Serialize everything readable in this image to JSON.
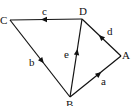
{
  "diagram": {
    "type": "vector-quadrilateral",
    "points": [
      {
        "id": "C",
        "label": "C",
        "x": 10,
        "y": 20
      },
      {
        "id": "D",
        "label": "D",
        "x": 82,
        "y": 19
      },
      {
        "id": "A",
        "label": "A",
        "x": 121,
        "y": 56
      },
      {
        "id": "B",
        "label": "B",
        "x": 70,
        "y": 97
      }
    ],
    "edges": [
      {
        "label": "c",
        "from": "D",
        "to": "C"
      },
      {
        "label": "b",
        "from": "C",
        "to": "B"
      },
      {
        "label": "a",
        "from": "B",
        "to": "A"
      },
      {
        "label": "d",
        "from": "A",
        "to": "D"
      },
      {
        "label": "e",
        "from": "B",
        "to": "D"
      }
    ],
    "stroke_color": "#111111"
  }
}
